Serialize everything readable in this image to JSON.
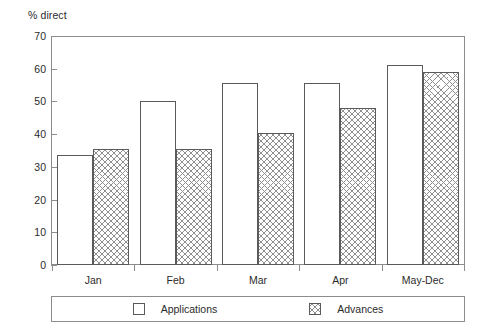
{
  "chart_data": {
    "type": "bar",
    "title": "",
    "subtitle": "",
    "xlabel": "",
    "ylabel": "% direct",
    "ylim": [
      0,
      70
    ],
    "yticks": [
      0,
      10,
      20,
      30,
      40,
      50,
      60,
      70
    ],
    "ytick_labels": [
      "0",
      "10",
      "20",
      "30",
      "40",
      "50",
      "60",
      "70"
    ],
    "grid": false,
    "legend_position": "bottom",
    "categories": [
      "Jan",
      "Feb",
      "Mar",
      "Apr",
      "May-Dec"
    ],
    "series": [
      {
        "name": "Applications",
        "fill": "white",
        "values": [
          33.5,
          50.0,
          55.5,
          55.5,
          61.0
        ]
      },
      {
        "name": "Advances",
        "fill": "cross-hatch",
        "values": [
          35.5,
          35.5,
          40.5,
          48.0,
          59.0
        ]
      }
    ]
  },
  "legend": {
    "items": [
      {
        "label": "Applications"
      },
      {
        "label": "Advances"
      }
    ]
  },
  "colors": {
    "axis": "#8c8c8c",
    "bar_outline": "#5a5a5a",
    "hatch": "#8f8f8f",
    "text": "#2b2b2b"
  }
}
